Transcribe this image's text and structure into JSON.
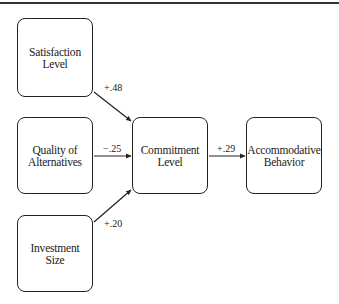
{
  "diagram": {
    "type": "path-diagram",
    "nodes": [
      {
        "id": "satisfaction",
        "label": "Satisfaction\nLevel"
      },
      {
        "id": "quality",
        "label": "Quality of\nAlternatives"
      },
      {
        "id": "investment",
        "label": "Investment\nSize"
      },
      {
        "id": "commitment",
        "label": "Commitment\nLevel"
      },
      {
        "id": "accommodative",
        "label": "Accommodative\nBehavior"
      }
    ],
    "edges": [
      {
        "from": "satisfaction",
        "to": "commitment",
        "label": "+.48"
      },
      {
        "from": "quality",
        "to": "commitment",
        "label": "−.25"
      },
      {
        "from": "investment",
        "to": "commitment",
        "label": "+.20"
      },
      {
        "from": "commitment",
        "to": "accommodative",
        "label": "+.29"
      }
    ]
  }
}
